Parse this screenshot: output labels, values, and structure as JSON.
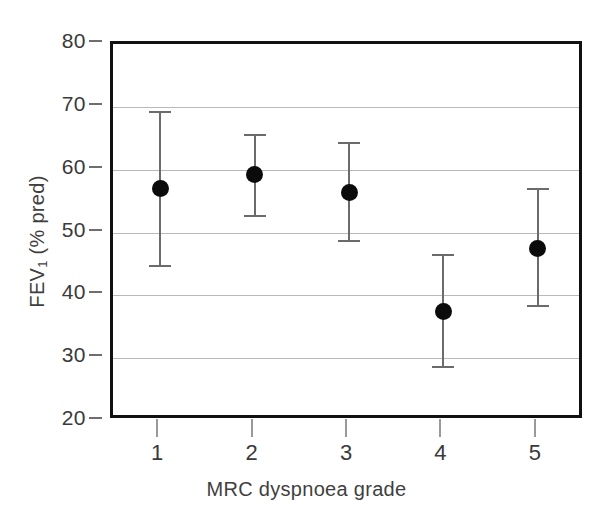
{
  "chart_data": {
    "type": "scatter",
    "title": "",
    "xlabel": "MRC dyspnoea grade",
    "ylabel": "FEV₁ (% pred)",
    "ylabel_main": "FEV",
    "ylabel_sub": "1",
    "ylabel_rest": " (% pred)",
    "categories": [
      "1",
      "2",
      "3",
      "4",
      "5"
    ],
    "values": [
      57.0,
      59.2,
      56.4,
      37.5,
      47.5
    ],
    "error_upper": [
      69.3,
      65.7,
      64.4,
      46.6,
      57.1
    ],
    "error_lower": [
      44.8,
      52.8,
      48.8,
      28.7,
      38.4
    ],
    "points": [
      {
        "category": "1",
        "value": 57.0,
        "upper": 69.3,
        "lower": 44.8
      },
      {
        "category": "2",
        "value": 59.2,
        "upper": 65.7,
        "lower": 52.8
      },
      {
        "category": "3",
        "value": 56.4,
        "upper": 64.4,
        "lower": 48.8
      },
      {
        "category": "4",
        "value": 37.5,
        "upper": 46.6,
        "lower": 28.7
      },
      {
        "category": "5",
        "value": 47.5,
        "upper": 57.1,
        "lower": 38.4
      }
    ],
    "ylim": [
      20,
      80
    ],
    "yticks": [
      80,
      70,
      60,
      50,
      40,
      30,
      20
    ],
    "ytick_labels": [
      "80",
      "70",
      "60",
      "50",
      "40",
      "30",
      "20"
    ],
    "xtick_labels": [
      "1",
      "2",
      "3",
      "4",
      "5"
    ],
    "grid": true,
    "grid_axis": "y",
    "legend": "none",
    "marker_color": "#0b0b0b",
    "errorbar_color": "#6b6b6b",
    "gridline_color": "#b9b9b9",
    "frame_color": "#111111",
    "background_color": "#ffffff"
  }
}
